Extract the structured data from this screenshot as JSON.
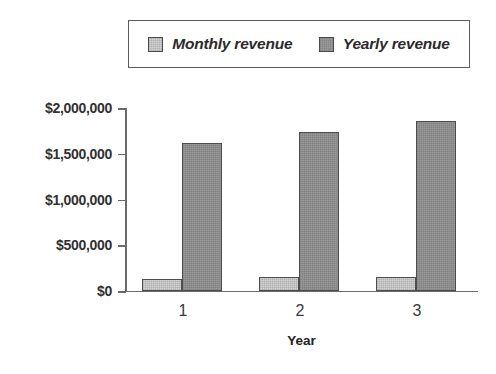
{
  "chart_data": {
    "type": "bar",
    "title": "",
    "xlabel": "Year",
    "ylabel": "",
    "categories": [
      "1",
      "2",
      "3"
    ],
    "series": [
      {
        "name": "Monthly revenue",
        "values": [
          130000,
          150000,
          155000
        ],
        "color": "#d4d4d4"
      },
      {
        "name": "Yearly revenue",
        "values": [
          1620000,
          1740000,
          1860000
        ],
        "color": "#9a9a9a"
      }
    ],
    "ylim": [
      0,
      2000000
    ],
    "ytick_values": [
      0,
      500000,
      1000000,
      1500000,
      2000000
    ],
    "ytick_labels": [
      "$0",
      "$500,000",
      "$1,000,000",
      "$1,500,000",
      "$2,000,000"
    ],
    "grid": false,
    "legend_position": "top",
    "legend_style": "italic-boxed"
  },
  "legend": {
    "entries": [
      {
        "label": "Monthly revenue",
        "swatch": "monthly-swatch-icon"
      },
      {
        "label": "Yearly revenue",
        "swatch": "yearly-swatch-icon"
      }
    ]
  },
  "axes": {
    "x_title": "Year",
    "x_labels": [
      "1",
      "2",
      "3"
    ],
    "y_labels": [
      "$2,000,000",
      "$1,500,000",
      "$1,000,000",
      "$500,000",
      "$0"
    ]
  }
}
